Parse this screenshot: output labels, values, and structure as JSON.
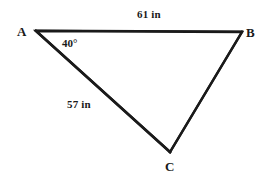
{
  "figure": {
    "shape": "triangle",
    "background_color": "#ffffff",
    "stroke_color": "#1a1a1a",
    "vertices": [
      {
        "name": "A",
        "label": "A",
        "x": 36,
        "y": 31
      },
      {
        "name": "B",
        "label": "B",
        "x": 242,
        "y": 32
      },
      {
        "name": "C",
        "label": "C",
        "x": 170,
        "y": 152
      }
    ],
    "sides": [
      {
        "name": "AB",
        "label": "61 in",
        "value": 61,
        "unit": "in",
        "from": "A",
        "to": "B"
      },
      {
        "name": "AC",
        "label": "57 in",
        "value": 57,
        "unit": "in",
        "from": "A",
        "to": "C"
      },
      {
        "name": "BC",
        "label": "",
        "from": "B",
        "to": "C"
      }
    ],
    "angles": [
      {
        "name": "A",
        "label": "40°",
        "value": 40,
        "unit": "degrees",
        "at_vertex": "A"
      }
    ]
  }
}
